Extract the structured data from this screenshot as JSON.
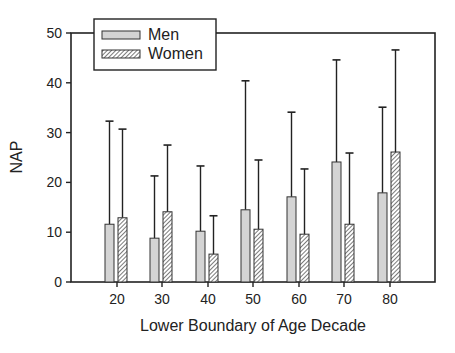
{
  "chart_data": {
    "type": "bar",
    "title": "",
    "xlabel": "Lower Boundary of Age Decade",
    "ylabel": "NAP",
    "categories": [
      "20",
      "30",
      "40",
      "50",
      "60",
      "70",
      "80"
    ],
    "ylim": [
      0,
      50
    ],
    "yticks": [
      0,
      10,
      20,
      30,
      40,
      50
    ],
    "grid": false,
    "legend_position": "top-left (inside, overlapping top frame)",
    "error_bars": "upper only (mean + SD caps)",
    "series": [
      {
        "name": "Men",
        "fill": "#d4d4d4",
        "pattern": "solid",
        "values": [
          11.6,
          8.8,
          10.2,
          14.5,
          17.1,
          24.1,
          17.9
        ],
        "error_upper": [
          32.3,
          21.3,
          23.3,
          40.4,
          34.1,
          44.6,
          35.1
        ]
      },
      {
        "name": "Women",
        "fill": "#ffffff",
        "pattern": "diagonal-hatch",
        "values": [
          12.9,
          14.1,
          5.6,
          10.6,
          9.6,
          11.6,
          26.1
        ],
        "error_upper": [
          30.7,
          27.5,
          13.3,
          24.5,
          22.7,
          25.9,
          46.6
        ]
      }
    ]
  },
  "legend": {
    "items": [
      {
        "label": "Men"
      },
      {
        "label": "Women"
      }
    ]
  },
  "axes": {
    "x_title": "Lower Boundary of Age Decade",
    "y_title": "NAP"
  }
}
